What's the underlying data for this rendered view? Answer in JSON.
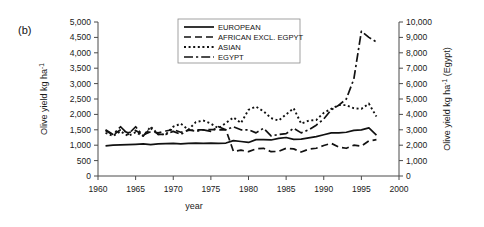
{
  "panel": {
    "label": "(b)"
  },
  "chart_data": {
    "type": "line",
    "title": "",
    "xlabel": "year",
    "ylabel": "Olive yield  kg ha-1",
    "ylabel_right": "Olive yield  kg ha -1  (Egypt)",
    "xlim": [
      1960,
      2000
    ],
    "ylim": [
      0,
      5000
    ],
    "ylim_right": [
      0,
      10000
    ],
    "xticks": [
      1960,
      1965,
      1970,
      1975,
      1980,
      1985,
      1990,
      1995,
      2000
    ],
    "xticklabels": [
      "1960",
      "1965",
      "1970",
      "1975",
      "1980",
      "1985",
      "1990",
      "1995",
      "2000"
    ],
    "yticks": [
      0,
      500,
      1000,
      1500,
      2000,
      2500,
      3000,
      3500,
      4000,
      4500,
      5000
    ],
    "yticklabels": [
      "0",
      "500",
      "1,000",
      "1,500",
      "2,000",
      "2,500",
      "3,000",
      "3,500",
      "4,000",
      "4,500",
      "5,000"
    ],
    "yticks_right": [
      0,
      1000,
      2000,
      3000,
      4000,
      5000,
      6000,
      7000,
      8000,
      9000,
      10000
    ],
    "yticklabels_right": [
      "0",
      "1,000",
      "2,000",
      "3,000",
      "4,000",
      "5,000",
      "6,000",
      "7,000",
      "8,000",
      "9,000",
      "10,000"
    ],
    "grid": false,
    "legend_position": "top-center",
    "x": [
      1961,
      1962,
      1963,
      1964,
      1965,
      1966,
      1967,
      1968,
      1969,
      1970,
      1971,
      1972,
      1973,
      1974,
      1975,
      1976,
      1977,
      1978,
      1979,
      1980,
      1981,
      1982,
      1983,
      1984,
      1985,
      1986,
      1987,
      1988,
      1989,
      1990,
      1991,
      1992,
      1993,
      1994,
      1995,
      1996,
      1997
    ],
    "series": [
      {
        "name": "EUROPEAN",
        "linestyle": "solid",
        "axis": "left",
        "values": [
          980,
          1000,
          1010,
          1020,
          1030,
          1040,
          1020,
          1040,
          1050,
          1060,
          1040,
          1060,
          1070,
          1060,
          1070,
          1060,
          1070,
          1150,
          1120,
          1090,
          1180,
          1180,
          1170,
          1220,
          1250,
          1190,
          1200,
          1240,
          1280,
          1340,
          1400,
          1400,
          1420,
          1480,
          1500,
          1560,
          1330
        ]
      },
      {
        "name": "AFRICAN EXCL. EGPYT",
        "linestyle": "dashed",
        "axis": "left",
        "values": [
          1480,
          1330,
          1500,
          1400,
          1480,
          1330,
          1440,
          1400,
          1460,
          1510,
          1420,
          1480,
          1500,
          1500,
          1510,
          1500,
          1500,
          800,
          840,
          790,
          880,
          900,
          790,
          800,
          900,
          880,
          780,
          870,
          900,
          990,
          1060,
          940,
          900,
          1000,
          970,
          1140,
          1180
        ]
      },
      {
        "name": "ASIAN",
        "linestyle": "dotted",
        "axis": "left",
        "values": [
          1400,
          1300,
          1450,
          1300,
          1420,
          1300,
          1600,
          1350,
          1350,
          1600,
          1700,
          1500,
          1750,
          1800,
          1700,
          1550,
          1720,
          1900,
          1720,
          2150,
          2250,
          2100,
          1880,
          1800,
          2000,
          2200,
          1700,
          1800,
          1820,
          2050,
          2180,
          2300,
          2300,
          2200,
          2180,
          2350,
          1930
        ]
      },
      {
        "name": "EGYPT",
        "linestyle": "dashdot",
        "axis": "right",
        "values": [
          3000,
          2700,
          3200,
          2700,
          3200,
          2600,
          3100,
          2700,
          2700,
          2900,
          2700,
          3000,
          2900,
          3000,
          2900,
          3200,
          3000,
          3200,
          3000,
          3000,
          2800,
          3100,
          2600,
          2700,
          2750,
          3100,
          2800,
          3000,
          3300,
          3700,
          4300,
          4600,
          5000,
          6300,
          9400,
          9000,
          8700
        ]
      }
    ]
  },
  "legend": {
    "items": [
      {
        "label": "EUROPEAN",
        "style": "solid"
      },
      {
        "label": "AFRICAN EXCL. EGPYT",
        "style": "dashed"
      },
      {
        "label": "ASIAN",
        "style": "dotted"
      },
      {
        "label": "EGYPT",
        "style": "dashdot"
      }
    ]
  }
}
